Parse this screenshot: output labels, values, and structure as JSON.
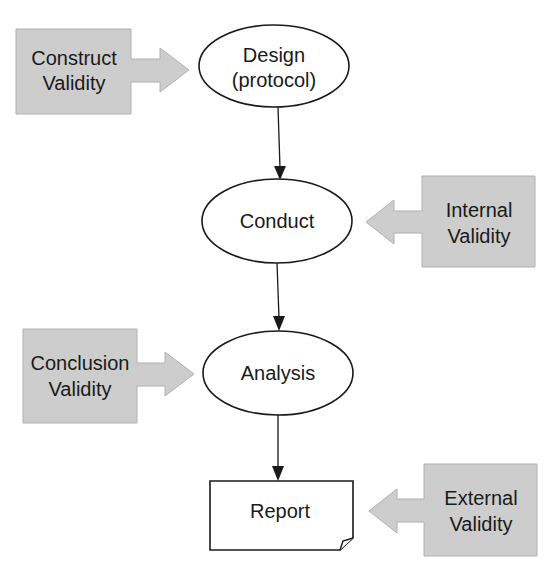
{
  "diagram": {
    "type": "flowchart",
    "colors": {
      "validity_fill": "#cdcdcd",
      "node_fill": "#ffffff",
      "stroke": "#1a1a1a"
    },
    "nodes": [
      {
        "id": "design",
        "shape": "ellipse",
        "line1": "Design",
        "line2": "(protocol)"
      },
      {
        "id": "conduct",
        "shape": "ellipse",
        "line1": "Conduct"
      },
      {
        "id": "analysis",
        "shape": "ellipse",
        "line1": "Analysis"
      },
      {
        "id": "report",
        "shape": "document",
        "line1": "Report"
      }
    ],
    "validities": [
      {
        "id": "construct",
        "line1": "Construct",
        "line2": "Validity",
        "points_to": "design",
        "side": "left"
      },
      {
        "id": "internal",
        "line1": "Internal",
        "line2": "Validity",
        "points_to": "conduct",
        "side": "right"
      },
      {
        "id": "conclusion",
        "line1": "Conclusion",
        "line2": "Validity",
        "points_to": "analysis",
        "side": "left"
      },
      {
        "id": "external",
        "line1": "External",
        "line2": "Validity",
        "points_to": "report",
        "side": "right"
      }
    ],
    "edges": [
      {
        "from": "design",
        "to": "conduct"
      },
      {
        "from": "conduct",
        "to": "analysis"
      },
      {
        "from": "analysis",
        "to": "report"
      }
    ]
  }
}
